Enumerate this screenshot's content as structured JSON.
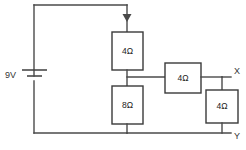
{
  "figure": {
    "background_color": "#ffffff",
    "wire_color": "#4a4a4a",
    "box_fill": "#ffffff",
    "box_stroke": "#3a3a3a",
    "text_color": "#222222"
  },
  "source": {
    "name": "battery",
    "label": "9V",
    "voltage_value": 9,
    "voltage_unit": "V"
  },
  "current_arrow": {
    "name": "current-direction-arrow",
    "direction": "down",
    "label": ""
  },
  "resistors": [
    {
      "id": "r1",
      "label": "4Ω",
      "value": 4,
      "unit": "Ω",
      "orientation": "vertical",
      "position": "upper-middle-branch"
    },
    {
      "id": "r2",
      "label": "8Ω",
      "value": 8,
      "unit": "Ω",
      "orientation": "vertical",
      "position": "lower-middle-branch"
    },
    {
      "id": "r3",
      "label": "4Ω",
      "value": 4,
      "unit": "Ω",
      "orientation": "horizontal",
      "position": "middle-right-branch"
    },
    {
      "id": "r4",
      "label": "4Ω",
      "value": 4,
      "unit": "Ω",
      "orientation": "vertical",
      "position": "far-right-branch"
    }
  ],
  "terminals": [
    {
      "id": "x",
      "label": "X",
      "position": "upper-right"
    },
    {
      "id": "y",
      "label": "Y",
      "position": "lower-right"
    }
  ]
}
